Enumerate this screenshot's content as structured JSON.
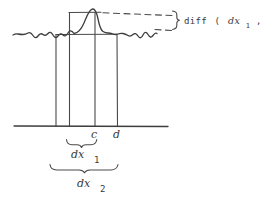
{
  "diagram": {
    "diff_label": {
      "func": "diff",
      "open_paren": "(",
      "arg1_base": "dx",
      "arg1_sub": "1",
      "separator": ",",
      "arg2_base": "dx",
      "arg2_sub": "2",
      "close_paren": ")"
    },
    "point_c": "c",
    "point_d": "d",
    "interval1_base": "dx",
    "interval1_sub": "1",
    "interval2_base": "dx",
    "interval2_sub": "2"
  },
  "colors": {
    "ink": "#3d3d3d",
    "background": "#ffffff"
  }
}
